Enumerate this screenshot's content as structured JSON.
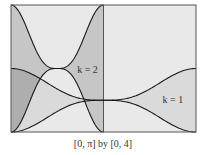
{
  "chart_data": {
    "type": "line",
    "title": "",
    "caption": "[0, π] by [0, 4]",
    "xlim": [
      0,
      3.14159
    ],
    "ylim": [
      0,
      4
    ],
    "grid": false,
    "divider_x": 1.5708,
    "colors": {
      "background": "#e9e9e9",
      "k1_fill": "#dadada",
      "k2_fill": "#c6c6c6",
      "curve": "#1a1a1a",
      "frame": "#555555"
    },
    "series": [
      {
        "name": "k = 2 upper",
        "k": 2,
        "formula": "y = k(1 + cos^3(kx))",
        "domain": [
          0,
          1.5708
        ],
        "points": [
          [
            0,
            4
          ],
          [
            0.39,
            3.35
          ],
          [
            0.785,
            2.0
          ],
          [
            1.18,
            3.35
          ],
          [
            1.5708,
            4
          ]
        ]
      },
      {
        "name": "k = 2 lower",
        "k": 2,
        "formula": "y = k(1 - cos^3(kx))",
        "domain": [
          0,
          1.5708
        ],
        "points": [
          [
            0,
            0
          ],
          [
            0.39,
            0.65
          ],
          [
            0.785,
            2.0
          ],
          [
            1.18,
            0.65
          ],
          [
            1.5708,
            0
          ]
        ]
      },
      {
        "name": "k = 1 upper",
        "k": 1,
        "formula": "y = k(1 + cos^3(kx))",
        "domain": [
          0,
          3.14159
        ],
        "points": [
          [
            0,
            2
          ],
          [
            0.785,
            1.35
          ],
          [
            1.5708,
            1.0
          ],
          [
            2.356,
            0.65
          ],
          [
            3.14159,
            0
          ]
        ]
      },
      {
        "name": "k = 1 lower",
        "k": 1,
        "formula": "y = k(1 - cos^3(kx))",
        "domain": [
          0,
          3.14159
        ],
        "points": [
          [
            0,
            0
          ],
          [
            0.785,
            0.65
          ],
          [
            1.5708,
            1.0
          ],
          [
            2.356,
            1.35
          ],
          [
            3.14159,
            2
          ]
        ]
      }
    ],
    "annotations": [
      {
        "text": "k = 2",
        "x": 1.3,
        "y": 2.0
      },
      {
        "text": "k = 1",
        "x": 2.75,
        "y": 1.05
      }
    ]
  }
}
